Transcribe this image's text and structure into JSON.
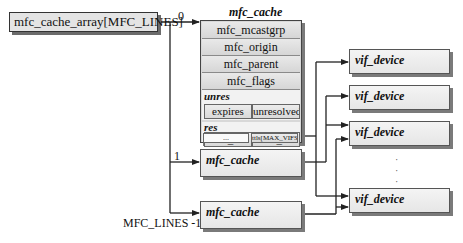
{
  "diagram": {
    "root": {
      "label": "mfc_cache_array[MFC_LINES]"
    },
    "index_labels": {
      "first": "0",
      "second": "1",
      "last": "MFC_LINES -1"
    },
    "mfc_cache_main": {
      "title": "mfc_cache",
      "fields": [
        "mfc_mcastgrp",
        "mfc_origin",
        "mfc_parent",
        "mfc_flags"
      ],
      "unres": {
        "label": "unres",
        "cells": [
          "expires",
          "unresolved"
        ]
      },
      "res": {
        "label": "res",
        "cells": [
          "min_vif",
          "max_vif",
          "...",
          "ttls[MAX_VIFS]"
        ]
      }
    },
    "mfc_cache_second": {
      "title": "mfc_cache"
    },
    "mfc_cache_last": {
      "title": "mfc_cache"
    },
    "vif_devices": [
      {
        "title": "vif_device"
      },
      {
        "title": "vif_device"
      },
      {
        "title": "vif_device"
      },
      {
        "title": "vif_device"
      }
    ],
    "ellipsis": "·\n·\n·"
  }
}
